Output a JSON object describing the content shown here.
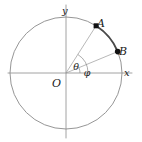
{
  "figure": {
    "width": 142,
    "height": 142,
    "background_color": "#ffffff"
  },
  "colors": {
    "axis": "#8c8c8c",
    "circle": "#8a8a8a",
    "radius_line": "#9a9a9a",
    "highlight_arc": "#4a4a4a",
    "angle_arc": "#8a8a8a",
    "point_fill": "#111111",
    "label_text": "#1a1a1a"
  },
  "geometry": {
    "center": {
      "x": 66,
      "y": 73
    },
    "radius": 56,
    "x_axis": {
      "x1": 8,
      "y1": 73,
      "x2": 132,
      "y2": 73
    },
    "y_axis": {
      "x1": 66,
      "y1": 5,
      "x2": 66,
      "y2": 138
    },
    "theta_degrees": 57.5,
    "phi_degrees": 22.5,
    "theta_arc_radius": 22,
    "phi_arc_radius": 14
  },
  "axes": {
    "x_label": "x",
    "x_label_pos": {
      "x": 124,
      "y": 76
    },
    "y_label": "y",
    "y_label_pos": {
      "x": 62,
      "y": 14
    }
  },
  "origin": {
    "label": "O",
    "label_pos": {
      "x": 52,
      "y": 87
    }
  },
  "points": [
    {
      "name": "A",
      "label": "A",
      "x": 96.1,
      "y": 25.8,
      "label_pos": {
        "x": 97,
        "y": 27
      },
      "angle_degrees": 57.5,
      "marker": "filled-square"
    },
    {
      "name": "B",
      "label": "B",
      "x": 117.7,
      "y": 51.6,
      "label_pos": {
        "x": 119,
        "y": 55
      },
      "angle_degrees": 22.5,
      "marker": "filled-circle"
    }
  ],
  "angles": [
    {
      "name": "theta",
      "label": "θ",
      "label_pos": {
        "x": 76,
        "y": 70
      },
      "from_degrees": 0,
      "to_degrees": 57.5
    },
    {
      "name": "phi",
      "label": "φ",
      "label_pos": {
        "x": 87,
        "y": 76
      },
      "from_degrees": 0,
      "to_degrees": 22.5
    }
  ]
}
